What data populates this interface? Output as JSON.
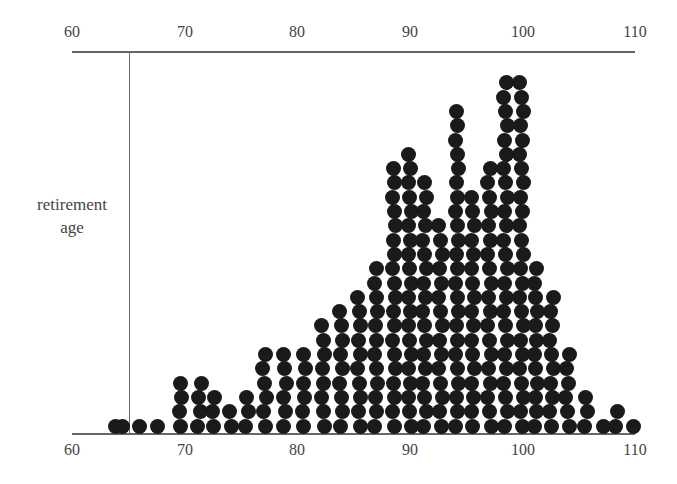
{
  "chart_data": {
    "type": "scatter",
    "subtype": "dot-plot",
    "title": "",
    "xlabel": "",
    "ylabel": "retirement age",
    "xlim": [
      60,
      110
    ],
    "x_ticks_top": [
      "60",
      "70",
      "80",
      "90",
      "100",
      "110"
    ],
    "x_ticks_bottom": [
      "60",
      "70",
      "80",
      "90",
      "100",
      "110"
    ],
    "reference_line_x": 65,
    "grid": false,
    "legend": null,
    "columns": [
      {
        "age": 64.0,
        "count": 1
      },
      {
        "age": 64.5,
        "count": 1
      },
      {
        "age": 65.8,
        "count": 1
      },
      {
        "age": 67.7,
        "count": 1
      },
      {
        "age": 69.6,
        "count": 4
      },
      {
        "age": 71.3,
        "count": 4
      },
      {
        "age": 72.6,
        "count": 3
      },
      {
        "age": 74.0,
        "count": 2
      },
      {
        "age": 75.5,
        "count": 3
      },
      {
        "age": 77.1,
        "count": 6
      },
      {
        "age": 78.9,
        "count": 6
      },
      {
        "age": 80.6,
        "count": 6
      },
      {
        "age": 82.3,
        "count": 8
      },
      {
        "age": 83.9,
        "count": 9
      },
      {
        "age": 85.5,
        "count": 10
      },
      {
        "age": 87.0,
        "count": 12
      },
      {
        "age": 88.6,
        "count": 19
      },
      {
        "age": 90.0,
        "count": 20
      },
      {
        "age": 91.3,
        "count": 18
      },
      {
        "age": 92.7,
        "count": 15
      },
      {
        "age": 94.2,
        "count": 23
      },
      {
        "age": 95.6,
        "count": 17
      },
      {
        "age": 97.1,
        "count": 19
      },
      {
        "age": 98.5,
        "count": 25
      },
      {
        "age": 99.9,
        "count": 25
      },
      {
        "age": 101.2,
        "count": 12
      },
      {
        "age": 102.6,
        "count": 10
      },
      {
        "age": 104.0,
        "count": 6
      },
      {
        "age": 105.6,
        "count": 3
      },
      {
        "age": 107.1,
        "count": 1
      },
      {
        "age": 108.4,
        "count": 2
      },
      {
        "age": 109.9,
        "count": 1
      }
    ]
  },
  "axis": {
    "top_labels": [
      "60",
      "70",
      "80",
      "90",
      "100",
      "110"
    ],
    "bottom_labels": [
      "60",
      "70",
      "80",
      "90",
      "100",
      "110"
    ],
    "ylabel_line1": "retirement",
    "ylabel_line2": "age"
  }
}
